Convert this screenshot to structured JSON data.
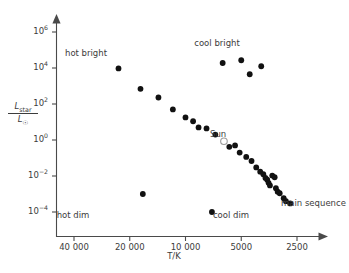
{
  "chart_data": {
    "type": "scatter",
    "title": "",
    "xlabel": "T/K",
    "ylabel_numerator": "L_star",
    "ylabel_denominator": "L_sun",
    "x_scale": "log-reversed",
    "y_scale": "log",
    "xlim": [
      40000,
      2210
    ],
    "ylim": [
      1e-05,
      4000000.0
    ],
    "grid": false,
    "legend": "none",
    "x_ticks": [
      {
        "value": 40000,
        "label": "40 000"
      },
      {
        "value": 20000,
        "label": "20 000"
      },
      {
        "value": 10000,
        "label": "10 000"
      },
      {
        "value": 5000,
        "label": "5000"
      },
      {
        "value": 2500,
        "label": "2500"
      }
    ],
    "y_ticks": [
      {
        "value": 1000000.0,
        "mantissa": "10",
        "exponent": "6"
      },
      {
        "value": 10000.0,
        "mantissa": "10",
        "exponent": "4"
      },
      {
        "value": 100.0,
        "mantissa": "10",
        "exponent": "2"
      },
      {
        "value": 1.0,
        "mantissa": "10",
        "exponent": "0"
      },
      {
        "value": 0.01,
        "mantissa": "10",
        "exponent": "−2"
      },
      {
        "value": 0.0001,
        "mantissa": "10",
        "exponent": "−4"
      }
    ],
    "series": [
      {
        "name": "main sequence",
        "marker": "filled-circle",
        "color": "#111111",
        "points": [
          {
            "t": 23000,
            "l": 9500
          },
          {
            "t": 17500,
            "l": 700
          },
          {
            "t": 14000,
            "l": 230
          },
          {
            "t": 11700,
            "l": 50
          },
          {
            "t": 10000,
            "l": 18
          },
          {
            "t": 9100,
            "l": 11
          },
          {
            "t": 8500,
            "l": 5.0
          },
          {
            "t": 7700,
            "l": 4.4
          },
          {
            "t": 6900,
            "l": 2.0
          },
          {
            "t": 5800,
            "l": 0.42
          },
          {
            "t": 5400,
            "l": 0.5
          },
          {
            "t": 5100,
            "l": 0.2
          },
          {
            "t": 4700,
            "l": 0.115
          },
          {
            "t": 4400,
            "l": 0.068
          },
          {
            "t": 4150,
            "l": 0.03
          },
          {
            "t": 3950,
            "l": 0.0175
          },
          {
            "t": 3800,
            "l": 0.0125
          },
          {
            "t": 3700,
            "l": 0.0078
          },
          {
            "t": 3620,
            "l": 0.0062
          },
          {
            "t": 3560,
            "l": 0.0042
          },
          {
            "t": 3500,
            "l": 0.003
          },
          {
            "t": 3400,
            "l": 0.0105
          },
          {
            "t": 3300,
            "l": 0.0085
          },
          {
            "t": 3250,
            "l": 0.0021
          },
          {
            "t": 3180,
            "l": 0.00135
          },
          {
            "t": 3100,
            "l": 0.0011
          },
          {
            "t": 2950,
            "l": 0.00058
          },
          {
            "t": 2870,
            "l": 0.0004
          },
          {
            "t": 2720,
            "l": 0.0003
          }
        ]
      },
      {
        "name": "cool bright giants",
        "marker": "filled-circle",
        "color": "#111111",
        "points": [
          {
            "t": 6300,
            "l": 19000
          },
          {
            "t": 5000,
            "l": 27000
          },
          {
            "t": 4500,
            "l": 4500
          },
          {
            "t": 3900,
            "l": 12500
          }
        ]
      },
      {
        "name": "hot dim white dwarfs",
        "marker": "filled-circle",
        "color": "#111111",
        "points": [
          {
            "t": 17000,
            "l": 0.001
          },
          {
            "t": 7200,
            "l": 0.0001
          }
        ]
      },
      {
        "name": "Sun",
        "marker": "open-circle",
        "color": "#9a9a9a",
        "points": [
          {
            "t": 6200,
            "l": 0.85
          }
        ]
      }
    ],
    "annotations": [
      {
        "name": "hot-bright",
        "text": "hot bright",
        "x": 86,
        "y": 49
      },
      {
        "name": "cool-bright",
        "text": "cool bright",
        "x": 217,
        "y": 39
      },
      {
        "name": "sun",
        "text": "Sun",
        "x": 210,
        "y": 130
      },
      {
        "name": "hot-dim",
        "text": "hot dim",
        "x": 73,
        "y": 211
      },
      {
        "name": "cool-dim",
        "text": "cool dim",
        "x": 231,
        "y": 211
      },
      {
        "name": "main-sequence",
        "text": "main sequence",
        "x": 281,
        "y": 199
      }
    ]
  },
  "axis_titles": {
    "x": "T/K",
    "y_num_base": "L",
    "y_num_sub": "star",
    "y_den_base": "L",
    "y_den_sub": "☉"
  },
  "colors": {
    "background": "#ffffff",
    "axis": "#4a4a4a",
    "text": "#3c3c3c",
    "marker": "#111111",
    "sun_outline": "#9a9a9a"
  }
}
